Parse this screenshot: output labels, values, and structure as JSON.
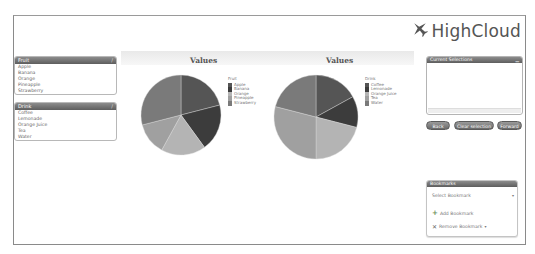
{
  "app": {
    "logo_text": "HighCloud",
    "logo_icon": "airplane-icon"
  },
  "listboxes": [
    {
      "title": "Fruit",
      "items": [
        "Apple",
        "Banana",
        "Orange",
        "Pineapple",
        "Strawberry"
      ]
    },
    {
      "title": "Drink",
      "items": [
        "Coffee",
        "Lemonade",
        "Orange Juice",
        "Tea",
        "Water"
      ]
    }
  ],
  "current_selections": {
    "title": "Current Selections",
    "minimize_icon": "minimize-icon"
  },
  "buttons": {
    "back": "Back",
    "clear_selection": "Clear selection",
    "forward": "Forward"
  },
  "bookmarks": {
    "title": "Bookmarks",
    "select_placeholder": "Select Bookmark",
    "add_label": "Add Bookmark",
    "remove_label": "Remove Bookmark"
  },
  "chart_data": [
    {
      "type": "pie",
      "title": "Values",
      "legend_title": "Fruit",
      "legend_position": "right",
      "categories": [
        "Apple",
        "Banana",
        "Orange",
        "Pineapple",
        "Strawberry"
      ],
      "values": [
        21,
        19,
        18,
        13,
        29
      ],
      "colors": [
        "#555555",
        "#3c3c3c",
        "#b4b4b4",
        "#a0a0a0",
        "#7a7a7a"
      ]
    },
    {
      "type": "pie",
      "title": "Values",
      "legend_title": "Drink",
      "legend_position": "right",
      "categories": [
        "Coffee",
        "Lemonade",
        "Orange Juice",
        "Tea",
        "Water"
      ],
      "values": [
        17,
        12,
        21,
        29,
        21
      ],
      "colors": [
        "#555555",
        "#3c3c3c",
        "#b4b4b4",
        "#a0a0a0",
        "#7a7a7a"
      ]
    }
  ]
}
